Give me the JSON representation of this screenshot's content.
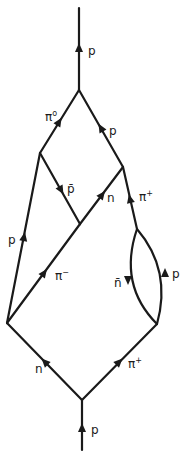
{
  "diagram": {
    "type": "particle-interaction-diagram",
    "vertices": {
      "bottom": [
        82,
        400
      ],
      "left": [
        7,
        323
      ],
      "loop_bottom": [
        157,
        324
      ],
      "loop_top": [
        137,
        229
      ],
      "junction": [
        80,
        224
      ],
      "right_upper": [
        123,
        167
      ],
      "left_upper": [
        40,
        153
      ],
      "top": [
        79,
        90
      ]
    },
    "lines": [
      {
        "id": "incoming-p",
        "label": "p",
        "from": "bottom-start",
        "to": "bottom"
      },
      {
        "id": "n-line",
        "label": "n",
        "from": "bottom",
        "to": "left"
      },
      {
        "id": "pi-plus-lower",
        "label": "π⁺",
        "from": "bottom",
        "to": "loop_bottom"
      },
      {
        "id": "p-left",
        "label": "p",
        "from": "left",
        "to": "left_upper"
      },
      {
        "id": "pi-minus",
        "label": "π⁻",
        "from": "left",
        "to": "junction"
      },
      {
        "id": "n-bar-loop",
        "label": "n̄",
        "from": "loop_top",
        "to": "loop_bottom"
      },
      {
        "id": "p-loop",
        "label": "p",
        "from": "loop_bottom",
        "to": "loop_top"
      },
      {
        "id": "pi-plus-upper",
        "label": "π⁺",
        "from": "loop_top",
        "to": "right_upper"
      },
      {
        "id": "p-bar",
        "label": "p̄",
        "from": "left_upper",
        "to": "junction"
      },
      {
        "id": "n-upper",
        "label": "n",
        "from": "junction",
        "to": "right_upper"
      },
      {
        "id": "pi-zero",
        "label": "π⁰",
        "from": "left_upper",
        "to": "top"
      },
      {
        "id": "p-right",
        "label": "p",
        "from": "right_upper",
        "to": "top"
      },
      {
        "id": "outgoing-p",
        "label": "p",
        "from": "top",
        "to": "top-end"
      }
    ],
    "labels": {
      "outgoing_p": "p",
      "pi_zero": "π",
      "pi_zero_sup": "o",
      "p_right": "p",
      "p_bar": "p̄",
      "n_upper": "n",
      "pi_plus_upper": "π",
      "pi_plus_upper_sup": "+",
      "p_left": "p",
      "pi_minus": "π",
      "pi_minus_sup": "−",
      "n_bar": "n̄",
      "p_loop": "p",
      "n_lower": "n",
      "pi_plus_lower": "π",
      "pi_plus_lower_sup": "+",
      "incoming_p": "p"
    }
  },
  "colors": {
    "line": "#1a1a1a",
    "background": "#ffffff"
  }
}
